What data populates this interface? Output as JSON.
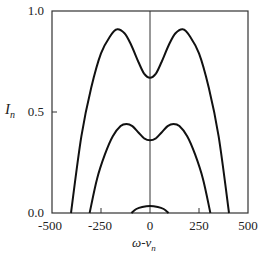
{
  "chart_data": {
    "type": "line",
    "title": "",
    "xlabel": "ω-ν_n",
    "ylabel": "I_n",
    "xlim": [
      -500,
      500
    ],
    "ylim": [
      0.0,
      1.0
    ],
    "x_ticks": [
      "-500",
      "-250",
      "0",
      "250",
      "500"
    ],
    "y_ticks": [
      "0.0",
      "0.5",
      "1.0"
    ],
    "grid": false,
    "legend": null,
    "annotations": [
      "vertical line at ω-ν_n = 0"
    ],
    "series": [
      {
        "name": "outer curve",
        "x": [
          -403,
          -350,
          -300,
          -250,
          -200,
          -168,
          -130,
          -100,
          -60,
          -30,
          0,
          30,
          60,
          100,
          130,
          168,
          200,
          250,
          300,
          350,
          403
        ],
        "values": [
          0.0,
          0.38,
          0.62,
          0.79,
          0.88,
          0.91,
          0.89,
          0.84,
          0.75,
          0.69,
          0.67,
          0.69,
          0.75,
          0.84,
          0.89,
          0.91,
          0.88,
          0.79,
          0.62,
          0.38,
          0.0
        ]
      },
      {
        "name": "middle curve",
        "x": [
          -308,
          -270,
          -230,
          -190,
          -150,
          -120,
          -90,
          -60,
          -30,
          0,
          30,
          60,
          90,
          120,
          150,
          190,
          230,
          270,
          308
        ],
        "values": [
          0.0,
          0.17,
          0.29,
          0.38,
          0.43,
          0.44,
          0.43,
          0.4,
          0.37,
          0.36,
          0.37,
          0.4,
          0.43,
          0.44,
          0.43,
          0.38,
          0.29,
          0.17,
          0.0
        ]
      },
      {
        "name": "inner curve",
        "x": [
          -95,
          -70,
          -40,
          0,
          40,
          70,
          95
        ],
        "values": [
          0.0,
          0.02,
          0.03,
          0.035,
          0.03,
          0.02,
          0.0
        ]
      }
    ]
  },
  "axes": {
    "xlabel": "ω-ν",
    "xlabel_sub": "n",
    "ylabel": "I",
    "ylabel_sub": "n",
    "x_ticks": [
      "-500",
      "-250",
      "0",
      "250",
      "500"
    ],
    "y_ticks": [
      "0.0",
      "0.5",
      "1.0"
    ]
  }
}
